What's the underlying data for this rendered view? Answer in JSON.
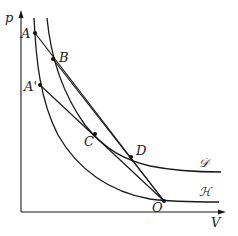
{
  "diagram": {
    "axes": {
      "y_label": "p",
      "x_label": "V"
    },
    "points": {
      "A": "A",
      "A_prime": "A'",
      "B": "B",
      "C": "C",
      "D": "D",
      "O": "O"
    },
    "curves": {
      "D_curve": "𝒟",
      "H_curve": "ℋ"
    },
    "segments": [
      "AO",
      "A'O",
      "BC",
      "OD"
    ]
  }
}
